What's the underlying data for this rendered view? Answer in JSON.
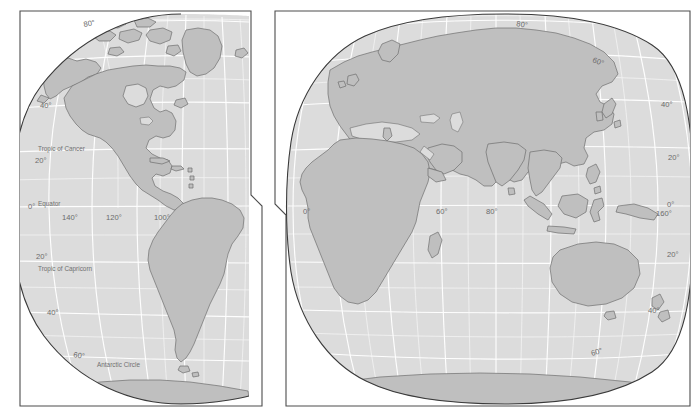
{
  "figure": {
    "name": "world-map-two-hemispheres",
    "projection": "interrupted globular / oval hemispheres",
    "background_color": "#ffffff",
    "land_color": "#bfbfbf",
    "land_outline_color": "#6e6e6e",
    "ocean_color": "#dcdcdc",
    "graticule_color": "#ffffff",
    "frame_color": "#4d4d4d",
    "label_color": "#6b6b6b",
    "panel_count": 2
  },
  "panels": [
    {
      "id": "west",
      "name": "western-hemisphere-panel",
      "latitude_labels": [
        {
          "text": "80°",
          "x": 84,
          "y": 27
        },
        {
          "text": "40°",
          "x": 40,
          "y": 108
        },
        {
          "text": "20°",
          "x": 35,
          "y": 163
        },
        {
          "text": "0°",
          "x": 30,
          "y": 208
        },
        {
          "text": "20°",
          "x": 36,
          "y": 259
        },
        {
          "text": "40°",
          "x": 47,
          "y": 315
        },
        {
          "text": "60°",
          "x": 73,
          "y": 357
        }
      ],
      "longitude_labels": [
        {
          "text": "140°",
          "x": 64,
          "y": 219
        },
        {
          "text": "120°",
          "x": 108,
          "y": 219
        },
        {
          "text": "100°",
          "x": 156,
          "y": 219
        }
      ],
      "named_lines": [
        {
          "text": "Tropic of Cancer",
          "x": 38,
          "y": 151
        },
        {
          "text": "Equator",
          "x": 38,
          "y": 206
        },
        {
          "text": "Tropic of Capricorn",
          "x": 38,
          "y": 271
        },
        {
          "text": "Antarctic Circle",
          "x": 97,
          "y": 366
        }
      ]
    },
    {
      "id": "east",
      "name": "eastern-hemisphere-panel",
      "latitude_labels": [
        {
          "text": "80°",
          "x": 518,
          "y": 26
        },
        {
          "text": "60°",
          "x": 594,
          "y": 61
        },
        {
          "text": "40°",
          "x": 663,
          "y": 107
        },
        {
          "text": "20°",
          "x": 670,
          "y": 160
        },
        {
          "text": "0°",
          "x": 668,
          "y": 205
        },
        {
          "text": "20°",
          "x": 668,
          "y": 257
        },
        {
          "text": "40°",
          "x": 650,
          "y": 313
        },
        {
          "text": "60°",
          "x": 594,
          "y": 356
        }
      ],
      "longitude_labels": [
        {
          "text": "0°",
          "x": 305,
          "y": 213
        },
        {
          "text": "60°",
          "x": 438,
          "y": 213
        },
        {
          "text": "80°",
          "x": 488,
          "y": 213
        },
        {
          "text": "160°",
          "x": 660,
          "y": 215
        }
      ],
      "named_lines": []
    }
  ]
}
